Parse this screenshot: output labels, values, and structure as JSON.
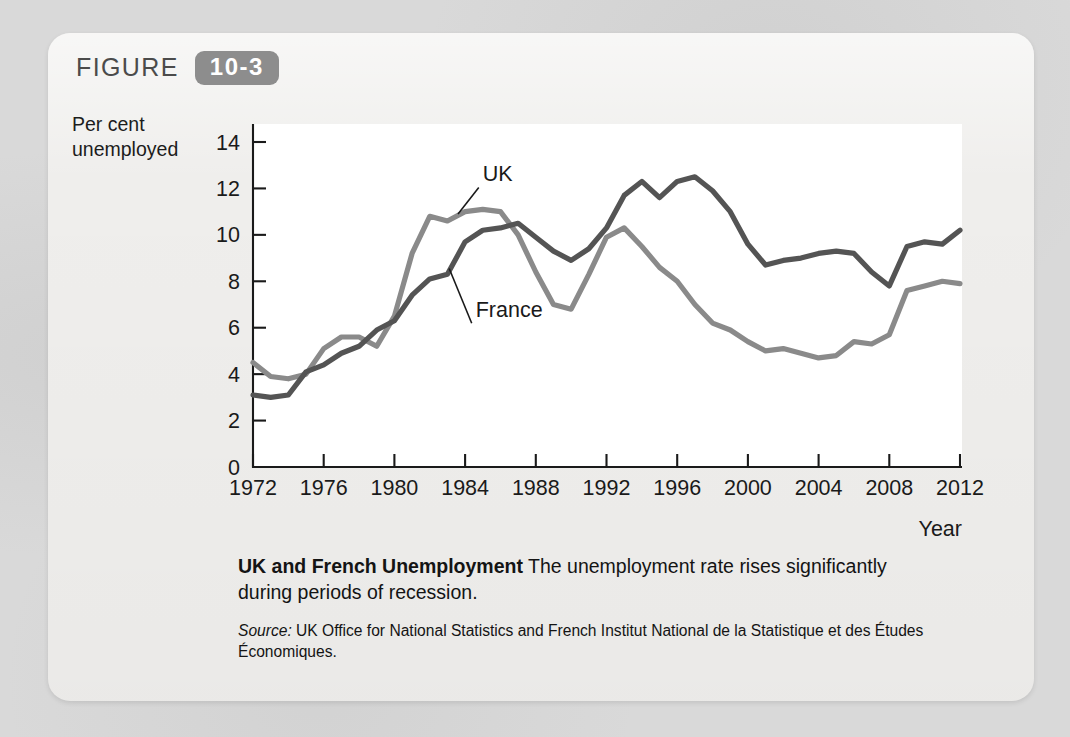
{
  "figure": {
    "label": "FIGURE",
    "number": "10-3"
  },
  "yaxis_title_line1": "Per cent",
  "yaxis_title_line2": "unemployed",
  "caption": {
    "title": "UK and French Unemployment",
    "body": " The unemployment rate rises significantly during periods of recession.",
    "source_label": "Source:",
    "source_text": " UK Office for National Statistics and French Institut National de la Statistique et des Études Économiques."
  },
  "colors": {
    "uk_line": "#8a8a8a",
    "france_line": "#545454",
    "axis": "#1a1a1a",
    "card_bg": "#efeeec",
    "page_bg": "#d9d9d9",
    "badge_bg": "#8d8d8d"
  },
  "chart_data": {
    "type": "line",
    "title": "UK and French Unemployment",
    "xlabel": "Year",
    "ylabel": "Per cent unemployed",
    "xlim": [
      1972,
      2012
    ],
    "ylim": [
      0,
      14
    ],
    "ytick_labels": [
      "0",
      "2",
      "4",
      "6",
      "8",
      "10",
      "12",
      "14"
    ],
    "yticks": [
      0,
      2,
      4,
      6,
      8,
      10,
      12,
      14
    ],
    "xtick_labels": [
      "1972",
      "1976",
      "1980",
      "1984",
      "1988",
      "1992",
      "1996",
      "2000",
      "2004",
      "2008",
      "2012"
    ],
    "xticks": [
      1972,
      1976,
      1980,
      1984,
      1988,
      1992,
      1996,
      2000,
      2004,
      2008,
      2012
    ],
    "grid": false,
    "legend": "inline-annotations",
    "annotations": [
      {
        "text": "UK",
        "x": 1985.0,
        "y": 12.3,
        "points_to_x": 1983.6,
        "points_to_y": 10.9
      },
      {
        "text": "France",
        "x": 1984.6,
        "y": 6.45,
        "points_to_x": 1983.1,
        "points_to_y": 8.55
      }
    ],
    "x": [
      1972,
      1973,
      1974,
      1975,
      1976,
      1977,
      1978,
      1979,
      1980,
      1981,
      1982,
      1983,
      1984,
      1985,
      1986,
      1987,
      1988,
      1989,
      1990,
      1991,
      1992,
      1993,
      1994,
      1995,
      1996,
      1997,
      1998,
      1999,
      2000,
      2001,
      2002,
      2003,
      2004,
      2005,
      2006,
      2007,
      2008,
      2009,
      2010,
      2011,
      2012
    ],
    "series": [
      {
        "name": "UK",
        "color": "#8a8a8a",
        "values": [
          4.5,
          3.9,
          3.8,
          4.0,
          5.1,
          5.6,
          5.6,
          5.2,
          6.5,
          9.2,
          10.8,
          10.6,
          11.0,
          11.1,
          11.0,
          10.0,
          8.4,
          7.0,
          6.8,
          8.3,
          9.9,
          10.3,
          9.5,
          8.6,
          8.0,
          7.0,
          6.2,
          5.9,
          5.4,
          5.0,
          5.1,
          4.9,
          4.7,
          4.8,
          5.4,
          5.3,
          5.7,
          7.6,
          7.8,
          8.0,
          7.9
        ],
        "estimated": true
      },
      {
        "name": "France",
        "color": "#545454",
        "values": [
          3.1,
          3.0,
          3.1,
          4.1,
          4.4,
          4.9,
          5.2,
          5.9,
          6.3,
          7.4,
          8.1,
          8.3,
          9.7,
          10.2,
          10.3,
          10.5,
          9.9,
          9.3,
          8.9,
          9.4,
          10.3,
          11.7,
          12.3,
          11.6,
          12.3,
          12.5,
          11.9,
          11.0,
          9.6,
          8.7,
          8.9,
          9.0,
          9.2,
          9.3,
          9.2,
          8.4,
          7.8,
          9.5,
          9.7,
          9.6,
          10.2
        ],
        "estimated": true
      }
    ]
  },
  "plot_geometry": {
    "x0_px": 253,
    "x1_px": 960,
    "y0_px": 467,
    "y14_px": 142
  }
}
